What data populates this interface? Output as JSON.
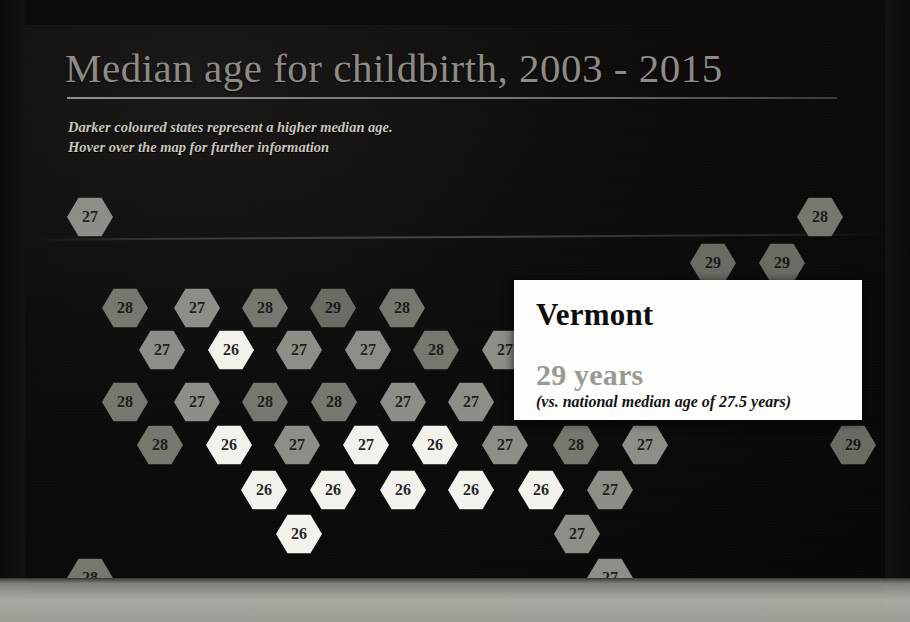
{
  "header": {
    "title": "Median age for childbirth, 2003 - 2015",
    "subtitle_line1": "Darker coloured states represent a higher median age.",
    "subtitle_line2": "Hover over the map for further information"
  },
  "tooltip": {
    "state": "Vermont",
    "value": "29 years",
    "note": "(vs. national median age of 27.5 years)"
  },
  "chart_data": {
    "type": "heatmap",
    "title": "Median age for childbirth, 2003 - 2015",
    "subtitle": "Darker coloured states represent a higher median age. Hover over the map for further information",
    "xlabel": "",
    "ylabel": "",
    "legend": "Darker coloured states represent a higher median age",
    "national_median": 27.5,
    "unit": "years",
    "value_range": [
      26,
      29
    ],
    "grid": false,
    "hovered_tile": "Vermont",
    "tiles": [
      {
        "label": "27",
        "value": 27,
        "x": 42,
        "y": 172,
        "shade": "lvl27"
      },
      {
        "label": "28",
        "value": 28,
        "x": 772,
        "y": 172,
        "shade": "lvl28"
      },
      {
        "label": "29",
        "value": 29,
        "x": 665,
        "y": 218,
        "shade": "lvl29"
      },
      {
        "label": "29",
        "value": 29,
        "x": 734,
        "y": 218,
        "shade": "lvl29"
      },
      {
        "label": "28",
        "value": 28,
        "x": 772,
        "y": 172,
        "shade": "lvl28",
        "skip": true
      },
      {
        "label": "28",
        "value": 28,
        "x": 77,
        "y": 263,
        "shade": "lvl28"
      },
      {
        "label": "27",
        "value": 27,
        "x": 149,
        "y": 263,
        "shade": "lvl27"
      },
      {
        "label": "28",
        "value": 28,
        "x": 217,
        "y": 263,
        "shade": "lvl28"
      },
      {
        "label": "29",
        "value": 29,
        "x": 285,
        "y": 263,
        "shade": "lvl29"
      },
      {
        "label": "28",
        "value": 28,
        "x": 354,
        "y": 263,
        "shade": "lvl28"
      },
      {
        "label": "27",
        "value": 27,
        "x": 114,
        "y": 305,
        "shade": "lvl27"
      },
      {
        "label": "26",
        "value": 26,
        "x": 183,
        "y": 305,
        "shade": "lvl26"
      },
      {
        "label": "27",
        "value": 27,
        "x": 251,
        "y": 305,
        "shade": "lvl27"
      },
      {
        "label": "27",
        "value": 27,
        "x": 320,
        "y": 305,
        "shade": "lvl27"
      },
      {
        "label": "28",
        "value": 28,
        "x": 388,
        "y": 305,
        "shade": "lvl28"
      },
      {
        "label": "27",
        "value": 27,
        "x": 457,
        "y": 305,
        "shade": "lvl27"
      },
      {
        "label": "28",
        "value": 28,
        "x": 77,
        "y": 357,
        "shade": "lvl28"
      },
      {
        "label": "27",
        "value": 27,
        "x": 149,
        "y": 357,
        "shade": "lvl27"
      },
      {
        "label": "28",
        "value": 28,
        "x": 217,
        "y": 357,
        "shade": "lvl28"
      },
      {
        "label": "28",
        "value": 28,
        "x": 286,
        "y": 357,
        "shade": "lvl28"
      },
      {
        "label": "27",
        "value": 27,
        "x": 355,
        "y": 357,
        "shade": "lvl27"
      },
      {
        "label": "27",
        "value": 27,
        "x": 423,
        "y": 357,
        "shade": "lvl27"
      },
      {
        "label": "28",
        "value": 28,
        "x": 112,
        "y": 400,
        "shade": "lvl28"
      },
      {
        "label": "26",
        "value": 26,
        "x": 181,
        "y": 400,
        "shade": "lvl26"
      },
      {
        "label": "27",
        "value": 27,
        "x": 249,
        "y": 400,
        "shade": "lvl27"
      },
      {
        "label": "27",
        "value": 27,
        "x": 318,
        "y": 400,
        "shade": "lvl26"
      },
      {
        "label": "26",
        "value": 26,
        "x": 387,
        "y": 400,
        "shade": "lvl26"
      },
      {
        "label": "27",
        "value": 27,
        "x": 457,
        "y": 400,
        "shade": "lvl27"
      },
      {
        "label": "28",
        "value": 28,
        "x": 528,
        "y": 400,
        "shade": "lvl28"
      },
      {
        "label": "27",
        "value": 27,
        "x": 597,
        "y": 400,
        "shade": "lvl27"
      },
      {
        "label": "29",
        "value": 29,
        "x": 805,
        "y": 400,
        "shade": "lvl29"
      },
      {
        "label": "26",
        "value": 26,
        "x": 216,
        "y": 445,
        "shade": "lvl26"
      },
      {
        "label": "26",
        "value": 26,
        "x": 285,
        "y": 445,
        "shade": "lvl26"
      },
      {
        "label": "26",
        "value": 26,
        "x": 355,
        "y": 445,
        "shade": "lvl26"
      },
      {
        "label": "26",
        "value": 26,
        "x": 423,
        "y": 445,
        "shade": "lvl26"
      },
      {
        "label": "26",
        "value": 26,
        "x": 493,
        "y": 445,
        "shade": "lvl26"
      },
      {
        "label": "27",
        "value": 27,
        "x": 562,
        "y": 445,
        "shade": "lvl27"
      },
      {
        "label": "26",
        "value": 26,
        "x": 251,
        "y": 489,
        "shade": "lvl26"
      },
      {
        "label": "27",
        "value": 27,
        "x": 529,
        "y": 489,
        "shade": "lvl27"
      },
      {
        "label": "28",
        "value": 28,
        "x": 42,
        "y": 533,
        "shade": "lvl28"
      },
      {
        "label": "27",
        "value": 27,
        "x": 562,
        "y": 533,
        "shade": "lvl27"
      }
    ]
  }
}
